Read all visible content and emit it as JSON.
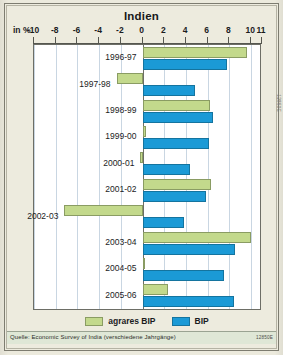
{
  "title": "Indien",
  "unit_label": "in %",
  "source": {
    "text": "Quelle: Economic Survey of India (verschiedene Jahrgänge)",
    "code": "12850E",
    "side_code": "12850E"
  },
  "legend": {
    "position": "bottom-center",
    "items": [
      {
        "label": "agrares BIP",
        "color": "#c3d98c"
      },
      {
        "label": "BIP",
        "color": "#1b9ad6"
      }
    ]
  },
  "chart_data": {
    "type": "bar",
    "orientation": "horizontal",
    "title": "Indien",
    "xlabel": "in %",
    "ylabel": "",
    "xlim": [
      -10,
      11
    ],
    "grid": true,
    "xticks": [
      -10,
      -8,
      -6,
      -4,
      -2,
      0,
      2,
      4,
      6,
      8,
      10,
      11
    ],
    "xticklabels": [
      "-10",
      "-8",
      "-6",
      "-4",
      "-2",
      "0",
      "2",
      "4",
      "6",
      "8",
      "10",
      "11"
    ],
    "categories": [
      "1996-97",
      "1997-98",
      "1998-99",
      "1999-00",
      "2000-01",
      "2001-02",
      "2002-03",
      "2003-04",
      "2004-05",
      "2005-06"
    ],
    "series": [
      {
        "name": "agrares BIP",
        "color": "#c3d98c",
        "values": [
          9.6,
          -2.4,
          6.2,
          0.3,
          -0.2,
          6.3,
          -7.2,
          10.0,
          0.1,
          2.3
        ]
      },
      {
        "name": "BIP",
        "color": "#1b9ad6",
        "values": [
          7.8,
          4.8,
          6.5,
          6.1,
          4.4,
          5.8,
          3.8,
          8.5,
          7.5,
          8.4
        ]
      }
    ]
  }
}
